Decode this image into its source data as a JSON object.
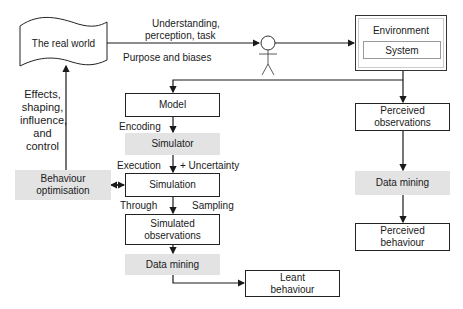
{
  "diagram": {
    "real_world": "The real world",
    "top_edge_label_line1": "Understanding,",
    "top_edge_label_line2": "perception, task",
    "purpose_label": "Purpose and biases",
    "environment": {
      "title": "Environment",
      "system": "System"
    },
    "left_label": [
      "Effects,",
      "shaping,",
      "influence,",
      "and",
      "control"
    ],
    "behaviour_optimisation": [
      "Behaviour",
      "optimisation"
    ],
    "model": "Model",
    "encoding": "Encoding",
    "simulator": "Simulator",
    "execution": "Execution",
    "uncertainty": "+  Uncertainty",
    "simulation": "Simulation",
    "through": "Through",
    "sampling": "Sampling",
    "simulated_observations": [
      "Simulated",
      "observations"
    ],
    "data_mining_left": "Data mining",
    "leant_behaviour": [
      "Leant",
      "behaviour"
    ],
    "perceived_observations": [
      "Perceived",
      "observations"
    ],
    "data_mining_right": "Data mining",
    "perceived_behaviour": [
      "Perceived",
      "behaviour"
    ]
  },
  "colors": {
    "line": "#1a1a1a",
    "gray_fill": "#e3e3e3",
    "box_border": "#222222"
  }
}
